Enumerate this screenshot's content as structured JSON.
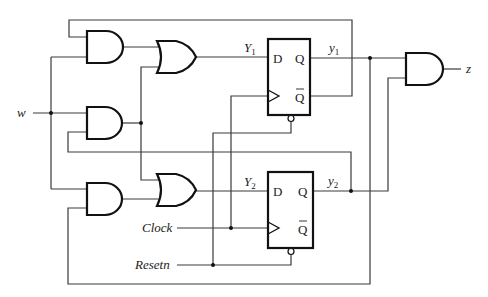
{
  "diagram": {
    "inputs": {
      "w": "w",
      "clock": "Clock",
      "resetn": "Resetn"
    },
    "output": {
      "z": "z"
    },
    "next_state_labels": {
      "Y1": "Y",
      "Y1_sub": "1",
      "Y2": "Y",
      "Y2_sub": "2"
    },
    "state_labels": {
      "y1": "y",
      "y1_sub": "1",
      "y2": "y",
      "y2_sub": "2"
    },
    "flip_flops": [
      {
        "name": "FF1",
        "d_pin": "D",
        "q_pin": "Q",
        "qbar_pin": "Q"
      },
      {
        "name": "FF2",
        "d_pin": "D",
        "q_pin": "Q",
        "qbar_pin": "Q"
      }
    ],
    "gates": [
      {
        "id": "and-top",
        "type": "AND"
      },
      {
        "id": "and-middle",
        "type": "AND"
      },
      {
        "id": "and-bottom",
        "type": "AND"
      },
      {
        "id": "or-top",
        "type": "OR"
      },
      {
        "id": "or-bottom",
        "type": "OR"
      },
      {
        "id": "and-output",
        "type": "AND"
      }
    ]
  }
}
